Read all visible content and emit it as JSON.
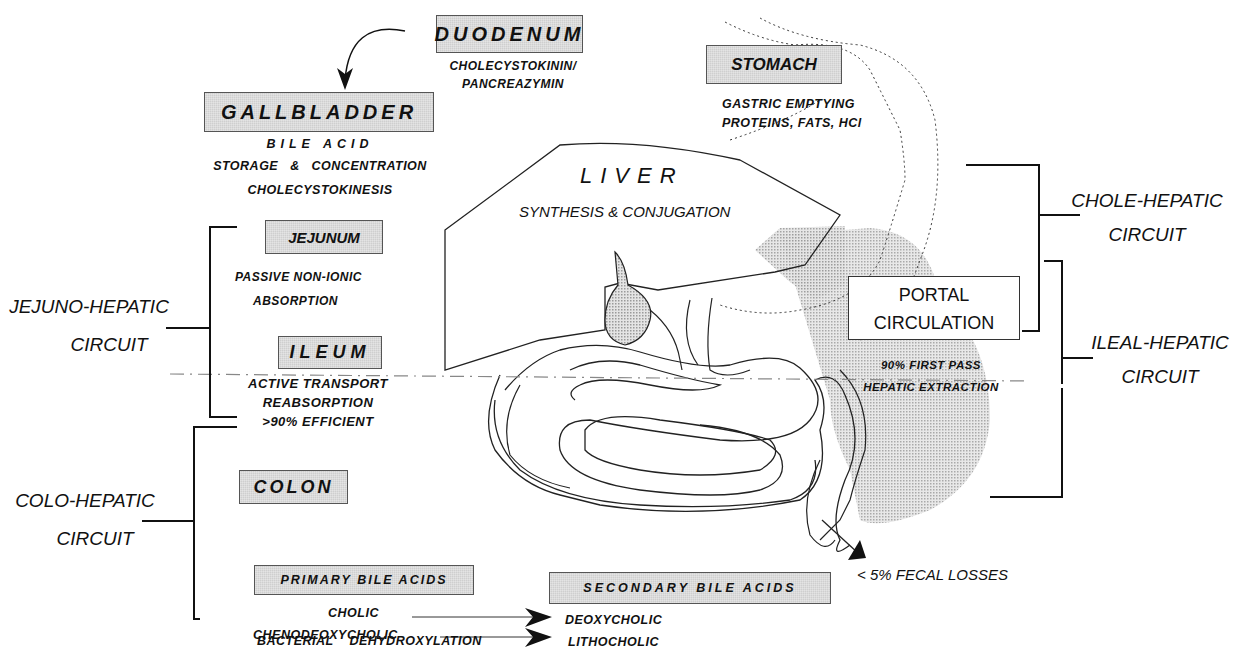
{
  "organs": {
    "duodenum": {
      "label": "DUODENUM",
      "notes": [
        "CHOLECYSTOKININ/",
        "PANCREAZYMIN"
      ]
    },
    "stomach": {
      "label": "STOMACH",
      "notes": [
        "GASTRIC EMPTYING",
        "PROTEINS,  FATS,  HCl"
      ]
    },
    "gallbladder": {
      "label": "GALLBLADDER",
      "notes": [
        "BILE ACID",
        "STORAGE   &   CONCENTRATION",
        "CHOLECYSTOKINESIS"
      ]
    },
    "liver": {
      "label": "LIVER",
      "notes": [
        "SYNTHESIS & CONJUGATION"
      ]
    },
    "jejunum": {
      "label": "JEJUNUM",
      "notes": [
        "PASSIVE NON-IONIC",
        "ABSORPTION"
      ]
    },
    "ileum": {
      "label": "ILEUM",
      "notes": [
        "ACTIVE TRANSPORT",
        "REABSORPTION",
        ">90% EFFICIENT"
      ]
    },
    "colon": {
      "label": "COLON",
      "notes": [
        "BACTERIAL    DECONJUGATION",
        "BACTERIAL    DEHYDROXYLATION"
      ]
    }
  },
  "portal": {
    "label_line1": "PORTAL",
    "label_line2": "CIRCULATION",
    "notes": [
      "90% FIRST PASS",
      "HEPATIC EXTRACTION"
    ]
  },
  "circuits": {
    "jejuno": [
      "JEJUNO-HEPATIC",
      "CIRCUIT"
    ],
    "colo": [
      "COLO-HEPATIC",
      "CIRCUIT"
    ],
    "chole": [
      "CHOLE-HEPATIC",
      "CIRCUIT"
    ],
    "ileal": [
      "ILEAL-HEPATIC",
      "CIRCUIT"
    ]
  },
  "bile_acids": {
    "primary_label": "PRIMARY  BILE ACIDS",
    "secondary_label": "SECONDARY  BILE ACIDS",
    "primary": [
      "CHOLIC",
      "CHENODEOXYCHOLIC"
    ],
    "secondary": [
      "DEOXYCHOLIC",
      "LITHOCHOLIC"
    ]
  },
  "fecal": "< 5% FECAL LOSSES",
  "colors": {
    "box_fill": "#cfcfcf",
    "shade": "#c8c8c8",
    "ink": "#111111"
  }
}
